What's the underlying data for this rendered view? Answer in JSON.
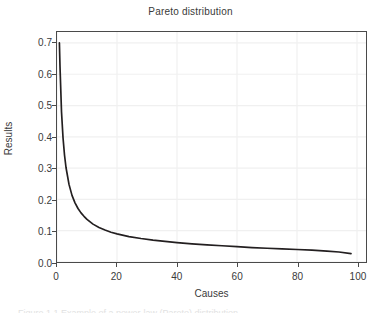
{
  "chart_data": {
    "type": "line",
    "title": "Pareto distribution",
    "xlabel": "Causes",
    "ylabel": "Results",
    "xlim": [
      0,
      103
    ],
    "ylim": [
      0.0,
      0.735
    ],
    "grid": true,
    "legend": "none",
    "line_color": "#231f20",
    "xticks": [
      0,
      20,
      40,
      60,
      80,
      100
    ],
    "xtick_labels": [
      "0",
      "20",
      "40",
      "60",
      "80",
      "100"
    ],
    "yticks": [
      0.0,
      0.1,
      0.2,
      0.3,
      0.4,
      0.5,
      0.6,
      0.7
    ],
    "ytick_labels": [
      "0.0",
      "0.1",
      "0.2",
      "0.3",
      "0.4",
      "0.5",
      "0.6",
      "0.7"
    ],
    "series": [
      {
        "name": "Pareto density",
        "x": [
          0.8,
          1,
          1.5,
          2,
          2.5,
          3,
          4,
          5,
          6,
          7,
          8,
          9,
          10,
          12,
          14,
          16,
          18,
          20,
          24,
          28,
          32,
          36,
          40,
          45,
          50,
          55,
          60,
          65,
          70,
          75,
          80,
          85,
          90,
          94,
          98
        ],
        "y": [
          0.7,
          0.625,
          0.48,
          0.398,
          0.342,
          0.302,
          0.248,
          0.213,
          0.189,
          0.171,
          0.157,
          0.146,
          0.136,
          0.121,
          0.11,
          0.102,
          0.095,
          0.09,
          0.081,
          0.075,
          0.07,
          0.066,
          0.062,
          0.058,
          0.055,
          0.052,
          0.049,
          0.046,
          0.044,
          0.042,
          0.04,
          0.038,
          0.035,
          0.032,
          0.027
        ]
      }
    ]
  },
  "figure": {
    "background": "#ffffff",
    "frame_color": "#4a4a4a",
    "grid_color": "#f0f0f0",
    "footer_artifact_text": "Figure 1.1 Example of a power-law (Pareto) distribution"
  }
}
